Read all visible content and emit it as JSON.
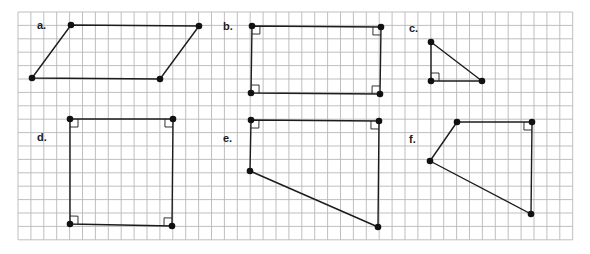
{
  "grid": {
    "x0": 18,
    "y0": 12,
    "dx": 12.9,
    "dy": 13.4,
    "cols": 43,
    "rows": 17,
    "line_color": "#b8b8b8",
    "border_color": "#a8a8a8"
  },
  "colors": {
    "stroke": "#1c1c1c",
    "dot": "#111111",
    "background": "#ffffff"
  },
  "figures": [
    {
      "id": "a",
      "label": "a.",
      "label_pos": [
        37,
        29
      ],
      "shape": "parallelogram",
      "points": [
        [
          71,
          25
        ],
        [
          199,
          26
        ],
        [
          160,
          79
        ],
        [
          32,
          78
        ]
      ],
      "right_angles": []
    },
    {
      "id": "b",
      "label": "b.",
      "label_pos": [
        223,
        30
      ],
      "shape": "rectangle",
      "points": [
        [
          252,
          26
        ],
        [
          381,
          27
        ],
        [
          380,
          94
        ],
        [
          251,
          93
        ]
      ],
      "right_angles": [
        0,
        1,
        2,
        3
      ]
    },
    {
      "id": "c",
      "label": "c.",
      "label_pos": [
        409,
        32
      ],
      "shape": "right triangle",
      "points": [
        [
          431,
          42
        ],
        [
          482,
          81
        ],
        [
          431,
          81
        ]
      ],
      "right_angles": [
        2
      ]
    },
    {
      "id": "d",
      "label": "d.",
      "label_pos": [
        37,
        141
      ],
      "shape": "rectangle",
      "points": [
        [
          70,
          119
        ],
        [
          173,
          119
        ],
        [
          172,
          226
        ],
        [
          70,
          224
        ]
      ],
      "right_angles": [
        0,
        1,
        2,
        3
      ]
    },
    {
      "id": "e",
      "label": "e.",
      "label_pos": [
        223,
        142
      ],
      "shape": "right trapezoid",
      "points": [
        [
          251,
          120
        ],
        [
          379,
          121
        ],
        [
          378,
          227
        ],
        [
          250,
          171
        ]
      ],
      "right_angles": [
        0,
        1
      ]
    },
    {
      "id": "f",
      "label": "f.",
      "label_pos": [
        409,
        143
      ],
      "shape": "quadrilateral",
      "points": [
        [
          457,
          122
        ],
        [
          532,
          122
        ],
        [
          531,
          214
        ],
        [
          430,
          161
        ]
      ],
      "right_angles": [
        1
      ]
    }
  ]
}
